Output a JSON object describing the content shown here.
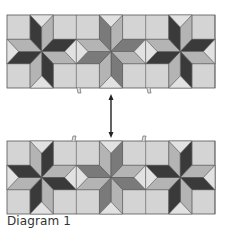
{
  "caption": "Diagram 1",
  "colors": {
    "background": "#d4d4d4",
    "dark": "#3a3a3a",
    "medium": "#7a7a7a",
    "light": "#b4b4b4",
    "outline": "#555555",
    "arrow": "#222222"
  },
  "panels": [
    {
      "name": "top-strip",
      "x": 7,
      "y": 15,
      "width": 208,
      "height": 73,
      "blocks": [
        {
          "ringA": "dark",
          "ringB": "light"
        },
        {
          "ringA": "medium",
          "ringB": "light"
        },
        {
          "ringA": "dark",
          "ringB": "light"
        }
      ],
      "tabs": [
        {
          "x": 79,
          "side": "bottom"
        },
        {
          "x": 149,
          "side": "bottom"
        }
      ]
    },
    {
      "name": "bottom-strip",
      "x": 7,
      "y": 141,
      "width": 208,
      "height": 73,
      "blocks": [
        {
          "ringA": "light",
          "ringB": "dark"
        },
        {
          "ringA": "light",
          "ringB": "medium"
        },
        {
          "ringA": "light",
          "ringB": "dark"
        }
      ],
      "tabs": [
        {
          "x": 74,
          "side": "top"
        },
        {
          "x": 144,
          "side": "top"
        }
      ]
    }
  ],
  "arrow": {
    "x": 111,
    "y1": 94,
    "y2": 138,
    "type": "double-headed"
  }
}
